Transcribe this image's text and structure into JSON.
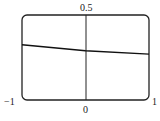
{
  "chart_data": {
    "type": "line",
    "title": "",
    "xlabel": "",
    "ylabel": "",
    "xlim": [
      -1,
      1
    ],
    "ylim": [
      -0.5,
      0.5
    ],
    "grid": false,
    "tick_labels": {
      "top": "0.5",
      "left": "−1",
      "center": "0",
      "right": "1"
    },
    "series": [
      {
        "name": "curve",
        "x": [
          -1,
          0,
          1
        ],
        "y": [
          0.15,
          0.08,
          0.04
        ]
      }
    ]
  }
}
